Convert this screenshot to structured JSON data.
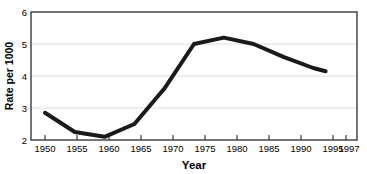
{
  "chart_data": {
    "type": "line",
    "title": "",
    "xlabel": "Year",
    "ylabel": "Rate per 1000",
    "x": [
      1950,
      1955,
      1960,
      1965,
      1970,
      1975,
      1980,
      1985,
      1990,
      1995,
      1997
    ],
    "xtick_labels": [
      "1950",
      "1955",
      "1960",
      "1965",
      "1970",
      "1975",
      "1980",
      "1985",
      "1990",
      "1995",
      "1997"
    ],
    "values": [
      2.85,
      2.25,
      2.1,
      2.5,
      3.6,
      5.0,
      5.2,
      5.0,
      4.6,
      4.25,
      4.15
    ],
    "ytick_labels": [
      "2",
      "3",
      "4",
      "5",
      "6"
    ],
    "yticks": [
      2,
      3,
      4,
      5,
      6
    ],
    "ylim": [
      2,
      6
    ],
    "xlim": [
      1950,
      1997
    ],
    "grid": true,
    "grid_axis": "y",
    "legend": false,
    "legend_position": "none",
    "series_color": "#1a1a1a",
    "grid_color": "#d9d9d9",
    "frame_color": "#333333",
    "background_color": "#ffffff",
    "line_width": 4
  }
}
